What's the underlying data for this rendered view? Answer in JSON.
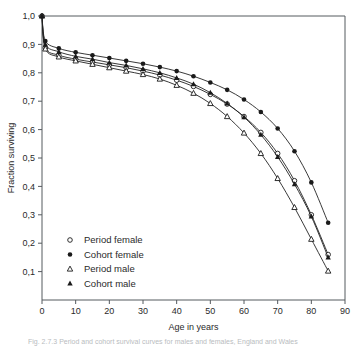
{
  "figure": {
    "caption": "Fig. 2.7.3 Period and cohort survival curves for males and females, England and Wales",
    "background": "#ffffff",
    "line_color": "#222222",
    "axis_color": "#555a5e"
  },
  "chart_data": {
    "type": "line",
    "title": "",
    "xlabel": "Age in years",
    "ylabel": "Fraction surviving",
    "xlim": [
      0,
      90
    ],
    "ylim": [
      0,
      1.0
    ],
    "xticks": [
      0,
      10,
      20,
      30,
      40,
      50,
      60,
      70,
      80,
      90
    ],
    "xticklabels": [
      "0",
      "10",
      "20",
      "30",
      "40",
      "50",
      "60",
      "70",
      "80",
      "90"
    ],
    "yticks": [
      0.1,
      0.2,
      0.3,
      0.4,
      0.5,
      0.6,
      0.7,
      0.8,
      0.9,
      1.0
    ],
    "yticklabels": [
      "0,1",
      "0,2",
      "0,3",
      "0,4",
      "0,5",
      "0,6",
      "0,7",
      "0,8",
      "0,9",
      "1,0"
    ],
    "grid": false,
    "legend_position": "lower-left-inside",
    "series": [
      {
        "name": "Period female",
        "marker": "open-circle",
        "x": [
          0,
          1,
          5,
          10,
          15,
          20,
          25,
          30,
          35,
          40,
          45,
          50,
          55,
          60,
          65,
          70,
          75,
          80,
          85
        ],
        "y": [
          1.0,
          0.888,
          0.862,
          0.848,
          0.838,
          0.828,
          0.818,
          0.806,
          0.792,
          0.774,
          0.752,
          0.724,
          0.69,
          0.646,
          0.59,
          0.516,
          0.42,
          0.3,
          0.16
        ]
      },
      {
        "name": "Cohort female",
        "marker": "filled-circle",
        "x": [
          0,
          1,
          5,
          10,
          15,
          20,
          25,
          30,
          35,
          40,
          45,
          50,
          55,
          60,
          65,
          70,
          75,
          80,
          85
        ],
        "y": [
          1.0,
          0.912,
          0.886,
          0.872,
          0.862,
          0.852,
          0.842,
          0.832,
          0.82,
          0.806,
          0.788,
          0.766,
          0.74,
          0.706,
          0.662,
          0.604,
          0.524,
          0.414,
          0.272
        ]
      },
      {
        "name": "Period male",
        "marker": "open-triangle",
        "x": [
          0,
          1,
          5,
          10,
          15,
          20,
          25,
          30,
          35,
          40,
          45,
          50,
          55,
          60,
          65,
          70,
          75,
          80,
          85
        ],
        "y": [
          1.0,
          0.884,
          0.856,
          0.842,
          0.83,
          0.818,
          0.806,
          0.794,
          0.778,
          0.756,
          0.728,
          0.692,
          0.646,
          0.588,
          0.516,
          0.428,
          0.326,
          0.214,
          0.102
        ]
      },
      {
        "name": "Cohort male",
        "marker": "filled-triangle",
        "x": [
          0,
          1,
          5,
          10,
          15,
          20,
          25,
          30,
          35,
          40,
          45,
          50,
          55,
          60,
          65,
          70,
          75,
          80,
          85
        ],
        "y": [
          1.0,
          0.9,
          0.874,
          0.858,
          0.848,
          0.836,
          0.826,
          0.814,
          0.8,
          0.782,
          0.76,
          0.73,
          0.692,
          0.644,
          0.582,
          0.504,
          0.408,
          0.294,
          0.15
        ]
      }
    ],
    "legend": [
      {
        "label": "Period female",
        "marker": "open-circle"
      },
      {
        "label": "Cohort female",
        "marker": "filled-circle"
      },
      {
        "label": "Period male",
        "marker": "open-triangle"
      },
      {
        "label": "Cohort male",
        "marker": "filled-triangle"
      }
    ]
  }
}
